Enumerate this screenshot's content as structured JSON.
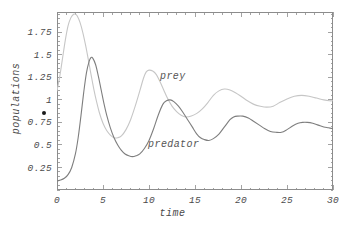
{
  "chart_data": {
    "type": "line",
    "title": "",
    "xlabel": "time",
    "ylabel": "populations",
    "xlim": [
      0,
      30
    ],
    "ylim": [
      0,
      1.975
    ],
    "grid": false,
    "frame": true,
    "legend_position": "inline-annotations",
    "xticks": [
      0,
      5,
      10,
      15,
      20,
      25,
      30
    ],
    "xtick_labels": [
      "0",
      "5",
      "10",
      "15",
      "20",
      "25",
      "30"
    ],
    "xminor_step": 1,
    "yticks": [
      0.25,
      0.5,
      0.75,
      1,
      1.25,
      1.5,
      1.75
    ],
    "ytick_labels": [
      "0.25",
      "0.5",
      "0.75",
      "1",
      "1.25",
      "1.5",
      "1.75"
    ],
    "yminor_step": 0.05,
    "annotations": [
      {
        "text": "prey",
        "x": 11.2,
        "y": 1.25
      },
      {
        "text": "predator",
        "x": 9.9,
        "y": 0.5
      }
    ],
    "series": [
      {
        "name": "prey",
        "color": "#c6c6c6",
        "width": 1.1,
        "x": [
          0,
          0.3,
          0.6,
          0.9,
          1.2,
          1.5,
          1.8,
          2.0,
          2.2,
          2.5,
          2.8,
          3.1,
          3.4,
          3.7,
          4.0,
          4.3,
          4.6,
          5.0,
          5.4,
          5.8,
          6.2,
          6.6,
          7.0,
          7.5,
          8.0,
          8.5,
          9.0,
          9.4,
          9.7,
          10.0,
          10.4,
          10.8,
          11.2,
          11.6,
          12.0,
          12.5,
          13.0,
          13.5,
          14.0,
          14.6,
          15.2,
          15.8,
          16.4,
          17.0,
          17.6,
          18.2,
          18.8,
          19.4,
          20.0,
          20.7,
          21.4,
          22.1,
          22.8,
          23.5,
          24.2,
          25.0,
          25.8,
          26.6,
          27.4,
          28.2,
          29.0,
          29.6,
          30.0
        ],
        "y": [
          1.1,
          1.26,
          1.46,
          1.66,
          1.82,
          1.91,
          1.95,
          1.95,
          1.93,
          1.86,
          1.75,
          1.61,
          1.45,
          1.28,
          1.12,
          0.98,
          0.86,
          0.74,
          0.66,
          0.61,
          0.58,
          0.58,
          0.6,
          0.67,
          0.78,
          0.93,
          1.1,
          1.24,
          1.31,
          1.33,
          1.32,
          1.28,
          1.2,
          1.11,
          1.02,
          0.93,
          0.87,
          0.83,
          0.81,
          0.82,
          0.85,
          0.9,
          0.97,
          1.05,
          1.1,
          1.12,
          1.11,
          1.08,
          1.04,
          0.99,
          0.95,
          0.93,
          0.92,
          0.93,
          0.97,
          1.01,
          1.04,
          1.05,
          1.04,
          1.02,
          1.0,
          0.99,
          0.99
        ]
      },
      {
        "name": "predator",
        "color": "#7e7e7e",
        "width": 1.1,
        "x": [
          0,
          0.4,
          0.8,
          1.2,
          1.6,
          2.0,
          2.3,
          2.6,
          2.9,
          3.2,
          3.5,
          3.7,
          3.9,
          4.2,
          4.5,
          4.8,
          5.1,
          5.4,
          5.8,
          6.2,
          6.6,
          7.0,
          7.4,
          7.8,
          8.2,
          8.6,
          9.0,
          9.5,
          10.0,
          10.5,
          11.0,
          11.5,
          11.9,
          12.3,
          12.7,
          13.2,
          13.7,
          14.2,
          14.7,
          15.2,
          15.6,
          16.0,
          16.5,
          17.0,
          17.6,
          18.2,
          18.8,
          19.2,
          19.6,
          20.2,
          20.8,
          21.4,
          22.0,
          22.6,
          23.2,
          23.8,
          24.4,
          25.0,
          25.6,
          26.2,
          26.7,
          27.2,
          27.8,
          28.4,
          29.0,
          29.5,
          30.0
        ],
        "y": [
          0.1,
          0.11,
          0.13,
          0.17,
          0.25,
          0.4,
          0.58,
          0.82,
          1.08,
          1.3,
          1.43,
          1.47,
          1.46,
          1.39,
          1.26,
          1.11,
          0.96,
          0.83,
          0.69,
          0.58,
          0.5,
          0.44,
          0.4,
          0.38,
          0.37,
          0.38,
          0.4,
          0.46,
          0.55,
          0.68,
          0.83,
          0.95,
          0.99,
          1.0,
          0.98,
          0.93,
          0.86,
          0.78,
          0.7,
          0.62,
          0.58,
          0.56,
          0.55,
          0.57,
          0.62,
          0.7,
          0.78,
          0.81,
          0.82,
          0.82,
          0.8,
          0.76,
          0.72,
          0.68,
          0.65,
          0.64,
          0.64,
          0.67,
          0.71,
          0.74,
          0.75,
          0.75,
          0.74,
          0.72,
          0.7,
          0.69,
          0.68
        ]
      }
    ]
  },
  "axes": {
    "x_title": "time",
    "y_title": "populations"
  },
  "colors": {
    "prey": "#c6c6c6",
    "predator": "#7e7e7e",
    "frame": "#8c8c8c",
    "text": "#4a4a4a",
    "background": "#ffffff"
  }
}
